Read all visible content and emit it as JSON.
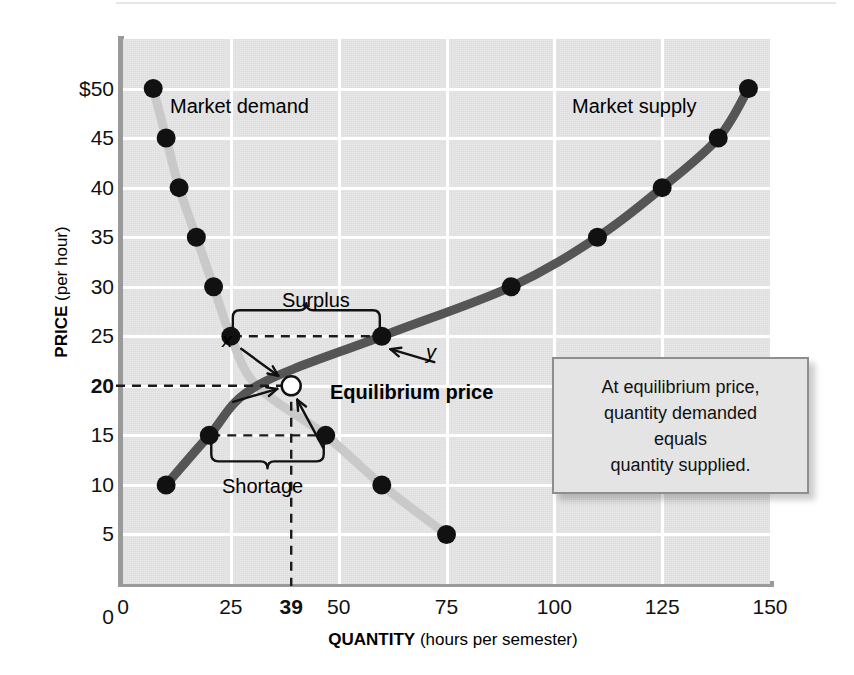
{
  "chart_data": {
    "type": "line",
    "title": "",
    "xlabel_bold": "QUANTITY",
    "xlabel_rest": " (hours per semester)",
    "ylabel_bold": "PRICE",
    "ylabel_rest": " (per hour)",
    "xlim": [
      0,
      150
    ],
    "ylim": [
      0,
      52
    ],
    "grid": true,
    "xticks": [
      {
        "value": 0,
        "label": "0",
        "bold": false
      },
      {
        "value": 25,
        "label": "25",
        "bold": false
      },
      {
        "value": 39,
        "label": "39",
        "bold": true
      },
      {
        "value": 50,
        "label": "50",
        "bold": false
      },
      {
        "value": 75,
        "label": "75",
        "bold": false
      },
      {
        "value": 100,
        "label": "100",
        "bold": false
      },
      {
        "value": 125,
        "label": "125",
        "bold": false
      },
      {
        "value": 150,
        "label": "150",
        "bold": false
      }
    ],
    "yticks": [
      {
        "value": 50,
        "label": "$50",
        "bold": false
      },
      {
        "value": 45,
        "label": "45",
        "bold": false
      },
      {
        "value": 40,
        "label": "40",
        "bold": false
      },
      {
        "value": 35,
        "label": "35",
        "bold": false
      },
      {
        "value": 30,
        "label": "30",
        "bold": false
      },
      {
        "value": 25,
        "label": "25",
        "bold": false
      },
      {
        "value": 20,
        "label": "20",
        "bold": true
      },
      {
        "value": 15,
        "label": "15",
        "bold": false
      },
      {
        "value": 10,
        "label": "10",
        "bold": false
      },
      {
        "value": 5,
        "label": "5",
        "bold": false
      },
      {
        "value": 0,
        "label": "0",
        "bold": false
      }
    ],
    "series": [
      {
        "name": "Market demand",
        "color": "#c9c9c9",
        "points": [
          {
            "q": 7,
            "p": 50
          },
          {
            "q": 10,
            "p": 45
          },
          {
            "q": 13,
            "p": 40
          },
          {
            "q": 17,
            "p": 35
          },
          {
            "q": 21,
            "p": 30
          },
          {
            "q": 25,
            "p": 25
          },
          {
            "q": 31,
            "p": 20
          },
          {
            "q": 47,
            "p": 15
          },
          {
            "q": 60,
            "p": 10
          },
          {
            "q": 75,
            "p": 5
          }
        ]
      },
      {
        "name": "Market supply",
        "color": "#555555",
        "points": [
          {
            "q": 10,
            "p": 10
          },
          {
            "q": 20,
            "p": 15
          },
          {
            "q": 31,
            "p": 20
          },
          {
            "q": 60,
            "p": 25
          },
          {
            "q": 90,
            "p": 30
          },
          {
            "q": 110,
            "p": 35
          },
          {
            "q": 125,
            "p": 40
          },
          {
            "q": 138,
            "p": 45
          },
          {
            "q": 145,
            "p": 50
          }
        ]
      }
    ],
    "equilibrium": {
      "q": 39,
      "p": 20,
      "label": "Equilibrium price"
    },
    "annotations": {
      "demand_label": "Market demand",
      "supply_label": "Market supply",
      "surplus_label": "Surplus",
      "shortage_label": "Shortage",
      "point_x_label": "x",
      "point_y_label": "y"
    }
  },
  "callout": {
    "line1": "At equilibrium price,",
    "line2": "quantity demanded",
    "line3": "equals",
    "line4": "quantity supplied."
  },
  "colors": {
    "panel": "#e7e7e7",
    "grid": "#ffffff",
    "demand": "#c9c9c9",
    "supply": "#555555",
    "marker": "#111111",
    "axis": "#9a9a9a"
  }
}
